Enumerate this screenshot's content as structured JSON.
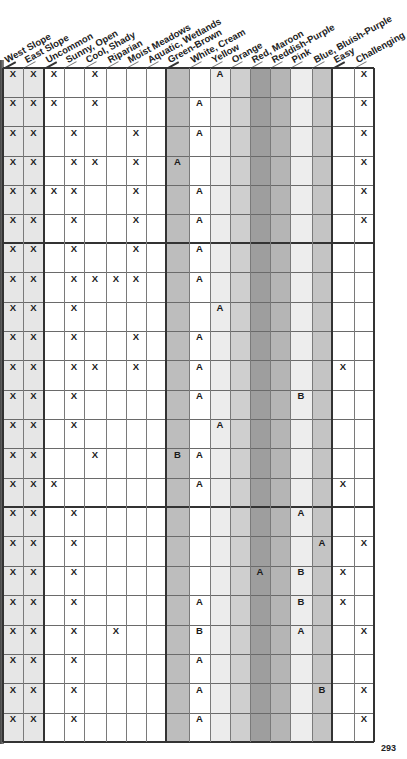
{
  "page_number": "293",
  "columns": [
    {
      "key": "west_slope",
      "label": "West Slope",
      "group": "range"
    },
    {
      "key": "east_slope",
      "label": "East Slope",
      "group": "range"
    },
    {
      "key": "uncommon",
      "label": "Uncommon",
      "group": "habitat"
    },
    {
      "key": "sunny_open",
      "label": "Sunny, Open",
      "group": "habitat"
    },
    {
      "key": "cool_shady",
      "label": "Cool, Shady",
      "group": "habitat"
    },
    {
      "key": "riparian",
      "label": "Riparian",
      "group": "habitat"
    },
    {
      "key": "moist_meadows",
      "label": "Moist Meadows",
      "group": "habitat"
    },
    {
      "key": "aquatic_wetlands",
      "label": "Aquatic, Wetlands",
      "group": "habitat"
    },
    {
      "key": "green_brown",
      "label": "Green-Brown",
      "group": "color"
    },
    {
      "key": "white_cream",
      "label": "White, Cream",
      "group": "color"
    },
    {
      "key": "yellow",
      "label": "Yellow",
      "group": "color"
    },
    {
      "key": "orange",
      "label": "Orange",
      "group": "color"
    },
    {
      "key": "red_maroon",
      "label": "Red, Maroon",
      "group": "color"
    },
    {
      "key": "reddish_purple",
      "label": "Reddish-Purple",
      "group": "color"
    },
    {
      "key": "pink",
      "label": "Pink",
      "group": "color"
    },
    {
      "key": "blue_bluish_purple",
      "label": "Blue, Bluish-Purple",
      "group": "color"
    },
    {
      "key": "easy",
      "label": "Easy",
      "group": "difficulty"
    },
    {
      "key": "challenging",
      "label": "Challenging",
      "group": "difficulty"
    }
  ],
  "column_shading": [
    "#e6e6e6",
    "#e6e6e6",
    "#ffffff",
    "#ffffff",
    "#ffffff",
    "#ffffff",
    "#ffffff",
    "#ffffff",
    "#bdbdbd",
    "#ffffff",
    "#ececec",
    "#cfcfcf",
    "#9e9e9e",
    "#b5b5b5",
    "#ededed",
    "#c4c4c4",
    "#ffffff",
    "#ffffff"
  ],
  "rows": [
    [
      "X",
      "X",
      "X",
      "",
      "X",
      "",
      "",
      "",
      "",
      "",
      "A",
      "",
      "",
      "",
      "",
      "",
      "",
      "X"
    ],
    [
      "X",
      "X",
      "X",
      "",
      "X",
      "",
      "",
      "",
      "",
      "A",
      "",
      "",
      "",
      "",
      "",
      "",
      "",
      "X"
    ],
    [
      "X",
      "X",
      "",
      "X",
      "",
      "",
      "X",
      "",
      "",
      "A",
      "",
      "",
      "",
      "",
      "",
      "",
      "",
      "X"
    ],
    [
      "X",
      "X",
      "",
      "X",
      "X",
      "",
      "X",
      "",
      "A",
      "",
      "",
      "",
      "",
      "",
      "",
      "",
      "",
      "X"
    ],
    [
      "X",
      "X",
      "X",
      "X",
      "",
      "",
      "X",
      "",
      "",
      "A",
      "",
      "",
      "",
      "",
      "",
      "",
      "",
      "X"
    ],
    [
      "X",
      "X",
      "",
      "X",
      "",
      "",
      "X",
      "",
      "",
      "A",
      "",
      "",
      "",
      "",
      "",
      "",
      "",
      "X"
    ],
    [
      "X",
      "X",
      "",
      "X",
      "",
      "",
      "X",
      "",
      "",
      "A",
      "",
      "",
      "",
      "",
      "",
      "",
      "",
      ""
    ],
    [
      "X",
      "X",
      "",
      "X",
      "X",
      "X",
      "X",
      "",
      "",
      "A",
      "",
      "",
      "",
      "",
      "",
      "",
      "",
      ""
    ],
    [
      "X",
      "X",
      "",
      "X",
      "",
      "",
      "",
      "",
      "",
      "",
      "A",
      "",
      "",
      "",
      "",
      "",
      "",
      ""
    ],
    [
      "X",
      "X",
      "",
      "X",
      "",
      "",
      "X",
      "",
      "",
      "A",
      "",
      "",
      "",
      "",
      "",
      "",
      "",
      ""
    ],
    [
      "X",
      "X",
      "",
      "X",
      "X",
      "",
      "X",
      "",
      "",
      "A",
      "",
      "",
      "",
      "",
      "",
      "",
      "X",
      ""
    ],
    [
      "X",
      "X",
      "",
      "X",
      "",
      "",
      "",
      "",
      "",
      "A",
      "",
      "",
      "",
      "",
      "B",
      "",
      "",
      ""
    ],
    [
      "X",
      "X",
      "",
      "X",
      "",
      "",
      "",
      "",
      "",
      "",
      "A",
      "",
      "",
      "",
      "",
      "",
      "",
      ""
    ],
    [
      "X",
      "X",
      "",
      "",
      "X",
      "",
      "",
      "",
      "B",
      "A",
      "",
      "",
      "",
      "",
      "",
      "",
      "",
      ""
    ],
    [
      "X",
      "X",
      "X",
      "",
      "",
      "",
      "",
      "",
      "",
      "A",
      "",
      "",
      "",
      "",
      "",
      "",
      "X",
      ""
    ],
    [
      "X",
      "X",
      "",
      "X",
      "",
      "",
      "",
      "",
      "",
      "",
      "",
      "",
      "",
      "",
      "A",
      "",
      "",
      ""
    ],
    [
      "X",
      "X",
      "",
      "X",
      "",
      "",
      "",
      "",
      "",
      "",
      "",
      "",
      "",
      "",
      "",
      "A",
      "",
      "X"
    ],
    [
      "X",
      "X",
      "",
      "X",
      "",
      "",
      "",
      "",
      "",
      "",
      "",
      "",
      "A",
      "",
      "B",
      "",
      "X",
      ""
    ],
    [
      "X",
      "X",
      "",
      "X",
      "",
      "",
      "",
      "",
      "",
      "A",
      "",
      "",
      "",
      "",
      "B",
      "",
      "X",
      ""
    ],
    [
      "X",
      "X",
      "",
      "X",
      "",
      "X",
      "",
      "",
      "",
      "B",
      "",
      "",
      "",
      "",
      "A",
      "",
      "",
      "X"
    ],
    [
      "X",
      "X",
      "",
      "X",
      "",
      "",
      "",
      "",
      "",
      "A",
      "",
      "",
      "",
      "",
      "",
      "",
      "",
      ""
    ],
    [
      "X",
      "X",
      "",
      "X",
      "",
      "",
      "",
      "",
      "",
      "A",
      "",
      "",
      "",
      "",
      "",
      "B",
      "",
      "X"
    ],
    [
      "X",
      "X",
      "",
      "X",
      "",
      "",
      "",
      "",
      "",
      "A",
      "",
      "",
      "",
      "",
      "",
      "",
      "",
      "X"
    ]
  ],
  "group_breaks_after_rows": [
    6,
    15
  ]
}
